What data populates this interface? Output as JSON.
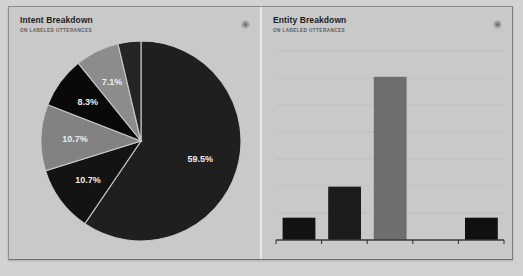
{
  "widget": {
    "background_color": "#c9c9c9",
    "border_color": "#8e8e8e",
    "divider_color": "#e8e8e8"
  },
  "panels": {
    "intent": {
      "title": "Intent Breakdown",
      "subtitle": "ON LABELED UTTERANCES",
      "info_icon": "info-icon"
    },
    "entity": {
      "title": "Entity Breakdown",
      "subtitle": "ON LABELED UTTERANCES",
      "info_icon": "info-icon"
    }
  },
  "chart_data": [
    {
      "type": "pie",
      "title": "Intent Breakdown",
      "subtitle": "ON LABELED UTTERANCES",
      "xlabel": "",
      "ylabel": "",
      "legend": "none",
      "grid": false,
      "start_angle_deg": 0,
      "direction": "clockwise",
      "labels": [
        "59.5%",
        "10.7%",
        "10.7%",
        "8.3%",
        "7.1%",
        ""
      ],
      "values": [
        59.5,
        10.7,
        10.7,
        8.3,
        7.1,
        3.7
      ],
      "colors": [
        "#1f1f1f",
        "#131313",
        "#828282",
        "#090909",
        "#8c8c8c",
        "#242424"
      ],
      "label_colors": [
        "#ededed",
        "#ededed",
        "#ededed",
        "#ededed",
        "#ededed",
        "#ededed"
      ]
    },
    {
      "type": "bar",
      "title": "Entity Breakdown",
      "subtitle": "ON LABELED UTTERANCES",
      "xlabel": "",
      "ylabel": "",
      "categories": [
        "1",
        "2",
        "3",
        "4",
        "5"
      ],
      "values": [
        13,
        31,
        95,
        13,
        11
      ],
      "ylim": [
        0,
        110
      ],
      "grid": true,
      "gridline_count": 7,
      "legend": "none",
      "tick_count": 6,
      "colors": [
        "#121212",
        "#1c1c1c",
        "#6e6e6e",
        "#101010",
        "#1a1a1a"
      ],
      "axis_color": "#3a3a3a",
      "gridline_color": "#bcbcbc"
    }
  ]
}
